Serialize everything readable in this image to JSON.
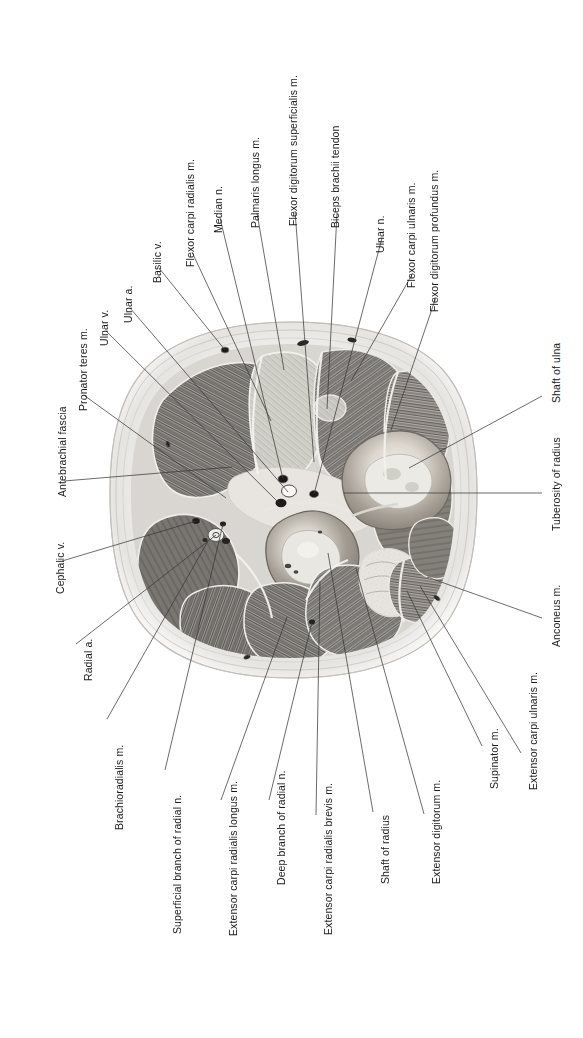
{
  "figure": {
    "background_color": "#ffffff",
    "leader_color": "#3a3a3a",
    "label_color": "#1b1b1b",
    "orientation_note": "All labels are rotated 90 degrees counter-clockwise",
    "width": 583,
    "height": 1038
  },
  "specimen": {
    "type": "anatomical-cross-section",
    "region": "forearm",
    "plane": "transverse",
    "description": "Greyscale cadaveric transverse section of the forearm showing muscle compartments, radius and ulna, vessels and nerves embedded in a pale oval of antebrachial fascia and subcutaneous tissue.",
    "bones": [
      {
        "name": "Shaft of radius",
        "tone": "#8e8a84"
      },
      {
        "name": "Shaft of ulna",
        "tone": "#8e8a84"
      }
    ]
  },
  "labels": [
    {
      "id": "antebrachial-fascia",
      "text": "Antebrachial fascia",
      "tx": 57,
      "ty": 497,
      "lx": 64,
      "ly": 481,
      "px": 232,
      "py": 467
    },
    {
      "id": "pronator-teres-m",
      "text": "Pronator teres m.",
      "tx": 78,
      "ty": 411,
      "lx": 85,
      "ly": 396,
      "px": 226,
      "py": 498
    },
    {
      "id": "ulnar-v",
      "text": "Ulnar v.",
      "tx": 99,
      "ty": 346,
      "lx": 106,
      "ly": 331,
      "px": 279,
      "py": 503
    },
    {
      "id": "ulnar-a",
      "text": "Ulnar a.",
      "tx": 123,
      "ty": 323,
      "lx": 130,
      "ly": 308,
      "px": 288,
      "py": 492
    },
    {
      "id": "basilic-v",
      "text": "Basilic v.",
      "tx": 152,
      "ty": 283,
      "lx": 159,
      "ly": 268,
      "px": 225,
      "py": 350
    },
    {
      "id": "flexor-carpi-radialis-m",
      "text": "Flexor carpi radialis m.",
      "tx": 185,
      "ty": 267,
      "lx": 192,
      "ly": 252,
      "px": 271,
      "py": 421
    },
    {
      "id": "median-n",
      "text": "Median n.",
      "tx": 213,
      "ty": 233,
      "lx": 220,
      "ly": 218,
      "px": 283,
      "py": 479
    },
    {
      "id": "palmaris-longus-m",
      "text": "Palmaris longus m.",
      "tx": 250,
      "ty": 228,
      "lx": 257,
      "ly": 213,
      "px": 284,
      "py": 370
    },
    {
      "id": "flexor-digitorum-superficialis-m",
      "text": "Flexor digitorum superficialis m.",
      "tx": 288,
      "ty": 226,
      "lx": 295,
      "ly": 211,
      "px": 314,
      "py": 462
    },
    {
      "id": "biceps-brachii-tendon",
      "text": "Biceps brachii tendon",
      "tx": 330,
      "ty": 228,
      "lx": 337,
      "ly": 213,
      "px": 327,
      "py": 409
    },
    {
      "id": "ulnar-n",
      "text": "Ulnar n.",
      "tx": 375,
      "ty": 253,
      "lx": 382,
      "ly": 238,
      "px": 314,
      "py": 494
    },
    {
      "id": "flexor-carpi-ulnaris-m",
      "text": "Flexor carpi ulnaris m.",
      "tx": 406,
      "ty": 288,
      "lx": 413,
      "ly": 273,
      "px": 351,
      "py": 381
    },
    {
      "id": "flexor-digitorum-profundus-m",
      "text": "Flexor digitorum profundus m.",
      "tx": 429,
      "ty": 312,
      "lx": 436,
      "ly": 297,
      "px": 391,
      "py": 430
    },
    {
      "id": "shaft-of-ulna",
      "text": "Shaft of ulna",
      "tx": 551,
      "ty": 403,
      "lx": 542,
      "ly": 396,
      "px": 409,
      "py": 468
    },
    {
      "id": "tuberosity-of-radius",
      "text": "Tuberosity of radius",
      "tx": 551,
      "ty": 531,
      "lx": 542,
      "ly": 493,
      "px": 344,
      "py": 493
    },
    {
      "id": "anconeus-m",
      "text": "Anconeus m.",
      "tx": 551,
      "ty": 647,
      "lx": 542,
      "ly": 618,
      "px": 427,
      "py": 577
    },
    {
      "id": "extensor-carpi-ulnaris-m",
      "text": "Extensor carpi ulnaris m.",
      "tx": 528,
      "ty": 790,
      "lx": 521,
      "ly": 753,
      "px": 420,
      "py": 586
    },
    {
      "id": "supinator-m",
      "text": "Supinator m.",
      "tx": 489,
      "ty": 789,
      "lx": 482,
      "ly": 746,
      "px": 407,
      "py": 591
    },
    {
      "id": "extensor-digitorum-m",
      "text": "Extensor digitorum m.",
      "tx": 431,
      "ty": 884,
      "lx": 424,
      "ly": 814,
      "px": 356,
      "py": 568
    },
    {
      "id": "shaft-of-radius",
      "text": "Shaft of radius",
      "tx": 380,
      "ty": 884,
      "lx": 373,
      "ly": 812,
      "px": 328,
      "py": 553
    },
    {
      "id": "extensor-carpi-radialis-brevis-m",
      "text": "Extensor carpi radialis brevis m.",
      "tx": 323,
      "ty": 935,
      "lx": 316,
      "ly": 815,
      "px": 320,
      "py": 581
    },
    {
      "id": "deep-branch-of-radial-n",
      "text": "Deep branch of radial n.",
      "tx": 276,
      "ty": 885,
      "lx": 269,
      "ly": 800,
      "px": 312,
      "py": 622
    },
    {
      "id": "extensor-carpi-radialis-longus-m",
      "text": "Extensor carpi radialis longus m.",
      "tx": 228,
      "ty": 936,
      "lx": 221,
      "ly": 800,
      "px": 287,
      "py": 617
    },
    {
      "id": "superficial-branch-of-radial-n",
      "text": "Superficial branch of radial n.",
      "tx": 172,
      "ty": 934,
      "lx": 165,
      "ly": 770,
      "px": 223,
      "py": 524
    },
    {
      "id": "brachioradialis-m",
      "text": "Brachioradialis m.",
      "tx": 114,
      "ty": 830,
      "lx": 107,
      "ly": 719,
      "px": 208,
      "py": 541
    },
    {
      "id": "radial-a",
      "text": "Radial a.",
      "tx": 83,
      "ty": 681,
      "lx": 76,
      "ly": 644,
      "px": 216,
      "py": 535
    },
    {
      "id": "cephalic-v",
      "text": "Cephalic v.",
      "tx": 55,
      "ty": 594,
      "lx": 62,
      "ly": 561,
      "px": 196,
      "py": 521
    }
  ]
}
